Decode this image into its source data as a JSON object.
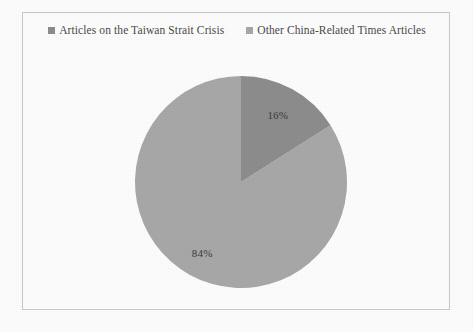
{
  "page": {
    "background_color": "#fdfdfd",
    "frame_border_color": "#c9c9c9"
  },
  "legend": {
    "position": "top-center",
    "entries": [
      {
        "label": "Articles on the Taiwan Strait Crisis",
        "color": "#8d8d8d",
        "marker": "square-marker"
      },
      {
        "label": "Other China-Related Times Articles",
        "color": "#a8a8a8",
        "marker": "square-marker"
      }
    ]
  },
  "chart_data": {
    "type": "pie",
    "title": "",
    "subtitle": "",
    "xlabel": "",
    "ylabel": "",
    "grid": false,
    "legend_position": "top",
    "categories": [
      "Articles on the Taiwan Strait Crisis",
      "Other China-Related Times Articles"
    ],
    "values": [
      16,
      84
    ],
    "value_unit": "percent",
    "data_labels": [
      "16%",
      "84%"
    ],
    "colors": [
      "#8d8d8d",
      "#a8a8a8"
    ],
    "start_angle_deg": 0,
    "direction": "clockwise",
    "annotations": []
  },
  "pie_geometry": {
    "center_x": 218,
    "center_y": 169,
    "radius": 106
  }
}
